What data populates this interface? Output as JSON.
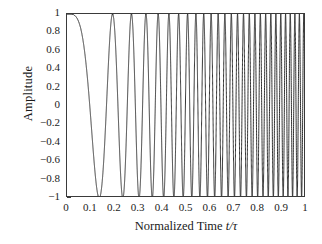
{
  "chart_data": {
    "type": "line",
    "title": "",
    "xlabel": "Normalized Time t/τ",
    "xlabel_parts": {
      "prefix": "Normalized Time ",
      "italic": "t/τ"
    },
    "ylabel": "Amplitude",
    "xlim": [
      0,
      1
    ],
    "ylim": [
      -1,
      1
    ],
    "grid": false,
    "legend": null,
    "xticks": [
      0,
      0.1,
      0.2,
      0.3,
      0.4,
      0.5,
      0.6,
      0.7,
      0.8,
      0.9,
      1
    ],
    "xticklabels": [
      "0",
      "0.1",
      "0.2",
      "0.3",
      "0.4",
      "0.5",
      "0.6",
      "0.7",
      "0.8",
      "0.9",
      "1"
    ],
    "yticks": [
      1,
      0.8,
      0.6,
      0.4,
      0.2,
      0,
      -0.2,
      -0.4,
      -0.6,
      -0.8,
      -1
    ],
    "yticklabels": [
      "1",
      "0.8",
      "0.6",
      "0.4",
      "0.2",
      "0",
      "−0.2",
      "−0.4",
      "−0.6",
      "−0.8",
      "−1"
    ],
    "series": [
      {
        "name": "linear chirp",
        "color": "#1a1a1a",
        "linewidth": 1.0,
        "description": "Amplitude = cos(2π(f0·t + (k/2)·t²)) linear frequency sweep",
        "formula": {
          "f0": 0.0,
          "f1": 55.0,
          "phase0_deg": 0,
          "amplitude": 1.0
        },
        "key_points": [
          {
            "t": 0.0,
            "y": 1.0,
            "note": "start at maximum"
          },
          {
            "t": 0.075,
            "y": 0.0,
            "note": "first zero crossing"
          },
          {
            "t": 0.14,
            "y": -1.0,
            "note": "first minimum"
          },
          {
            "t": 0.2,
            "y": 1.0,
            "note": "first full cycle complete"
          },
          {
            "t": 0.5,
            "y": 1.0,
            "note": "instantaneous frequency ~27.5 cycles/unit"
          },
          {
            "t": 1.0,
            "y": 1.0,
            "note": "instantaneous frequency ~55 cycles/unit"
          }
        ]
      }
    ]
  },
  "axes": {
    "frame_color": "#3a3a3a",
    "background": "#ffffff"
  }
}
